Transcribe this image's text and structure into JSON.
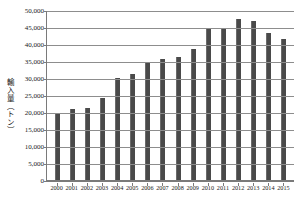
{
  "chart_data": {
    "type": "bar",
    "title": "",
    "subtitle": "",
    "xlabel": "",
    "ylabel": "輸入量（トン）",
    "categories": [
      "2000",
      "2001",
      "2002",
      "2003",
      "2004",
      "2005",
      "2006",
      "2007",
      "2008",
      "2009",
      "2010",
      "2011",
      "2012",
      "2013",
      "2014",
      "2015"
    ],
    "values": [
      19600,
      21000,
      21300,
      24200,
      30100,
      31300,
      34500,
      35600,
      36100,
      38600,
      44400,
      44300,
      47400,
      46900,
      43200,
      41500
    ],
    "series": [
      {
        "name": "輸入量",
        "values": [
          19600,
          21000,
          21300,
          24200,
          30100,
          31300,
          34500,
          35600,
          36100,
          38600,
          44400,
          44300,
          47400,
          46900,
          43200,
          41500
        ]
      }
    ],
    "ylim": [
      0,
      50000
    ],
    "ytick_values": [
      0,
      5000,
      10000,
      15000,
      20000,
      25000,
      30000,
      35000,
      40000,
      45000,
      50000
    ],
    "ytick_labels": [
      "0",
      "5,000",
      "10,000",
      "15,000",
      "20,000",
      "25,000",
      "30,000",
      "35,000",
      "40,000",
      "45,000",
      "50,000"
    ],
    "grid": true,
    "grid_axis": "y",
    "legend": false,
    "legend_position": "none",
    "bar_color": "#4a4a4a",
    "grid_color": "#8d8d8d",
    "axis_color": "#7a7a7a",
    "background_color": "#ffffff"
  }
}
